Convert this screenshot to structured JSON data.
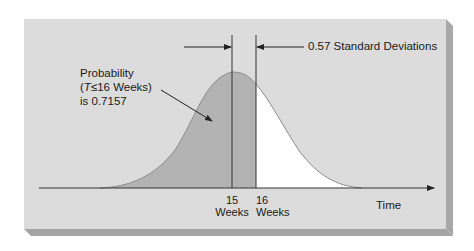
{
  "diagram": {
    "type": "normal-distribution-probability",
    "annotation": {
      "line1": "Probability",
      "line2_var": "T",
      "line2_rest": "≤16 Weeks)",
      "line2_open": "(",
      "line3": "is 0.7157"
    },
    "distance_label": "0.57 Standard Deviations",
    "x_axis": {
      "label": "Time",
      "ticks": [
        {
          "value": "15",
          "unit": "Weeks"
        },
        {
          "value": "16",
          "unit": "Weeks"
        }
      ]
    },
    "values": {
      "mean_weeks": 15,
      "cutoff_weeks": 16,
      "z": 0.57,
      "probability": 0.7157
    },
    "colors": {
      "panel": "#dcdcdc",
      "panel_shadow": "#a9a9a9",
      "shaded_area": "#b5b5b5",
      "unshaded_area": "#ffffff",
      "line": "#3a3a3a"
    }
  }
}
